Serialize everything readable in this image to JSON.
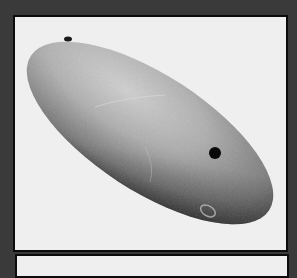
{
  "image": {
    "subject": "polished oval stone artifact with two drilled holes",
    "background_color": "#3a3a3a",
    "frame_color": "#0c0c0c",
    "photo_background": "#efefef",
    "stone_colors": {
      "light": "#cfcfcf",
      "mid": "#a8a8a8",
      "dark": "#4a4a4a"
    },
    "holes": [
      {
        "name": "upper-left hole",
        "cx": 53,
        "cy": 22,
        "rx": 4,
        "ry": 2.5
      },
      {
        "name": "right hole",
        "cx": 200,
        "cy": 136,
        "rx": 6,
        "ry": 6
      }
    ]
  }
}
